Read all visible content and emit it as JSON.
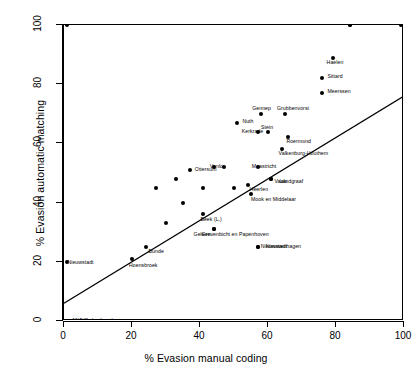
{
  "chart_data": {
    "type": "scatter",
    "title": "",
    "xlabel": "% Evasion manual coding",
    "ylabel": "% Evasion automatic matching",
    "xlim": [
      0,
      100
    ],
    "ylim": [
      0,
      100
    ],
    "xticks": [
      0,
      20,
      40,
      60,
      80,
      100
    ],
    "yticks": [
      0,
      20,
      40,
      60,
      80,
      100
    ],
    "grid": false,
    "legend": false,
    "trendline": {
      "description": "linear regression line",
      "x_start": 0,
      "y_start": 6,
      "x_end": 100,
      "y_end": 76
    },
    "points": [
      {
        "label": "Schinnen",
        "x": 1,
        "y": 100,
        "label_dx": 6,
        "label_dy": -2
      },
      {
        "label": "Echt",
        "x": 84,
        "y": 100,
        "label_dx": -8,
        "label_dy": -6
      },
      {
        "label": "Eijsden",
        "x": 84,
        "y": 100,
        "label_dx": -3,
        "label_dy": -6
      },
      {
        "label": "",
        "x": 99,
        "y": 100,
        "label_dx": 0,
        "label_dy": 0
      },
      {
        "label": "Sc",
        "x": 100,
        "y": 100,
        "label_dx": 5,
        "label_dy": -2
      },
      {
        "label": "Haelen",
        "x": 79,
        "y": 89,
        "label_dx": -6,
        "label_dy": 4
      },
      {
        "label": "Sittard",
        "x": 76,
        "y": 82,
        "label_dx": 5,
        "label_dy": -2
      },
      {
        "label": "Meerssen",
        "x": 76,
        "y": 77,
        "label_dx": 5,
        "label_dy": -2
      },
      {
        "label": "Gennep",
        "x": 58,
        "y": 70,
        "label_dx": -9,
        "label_dy": -6
      },
      {
        "label": "Grubbenvorst",
        "x": 65,
        "y": 70,
        "label_dx": -8,
        "label_dy": -6
      },
      {
        "label": "Nuth",
        "x": 51,
        "y": 67,
        "label_dx": 5,
        "label_dy": -2
      },
      {
        "label": "Kerkrade",
        "x": 57,
        "y": 64,
        "label_dx": -16,
        "label_dy": -1
      },
      {
        "label": "Stein",
        "x": 60,
        "y": 64,
        "label_dx": -7,
        "label_dy": -5
      },
      {
        "label": "Roermond",
        "x": 66,
        "y": 62,
        "label_dx": -2,
        "label_dy": 4
      },
      {
        "label": "Valkenburg-Houthem",
        "x": 64,
        "y": 58,
        "label_dx": -3,
        "label_dy": 4
      },
      {
        "label": "Venlo",
        "x": 47,
        "y": 52,
        "label_dx": -14,
        "label_dy": -1
      },
      {
        "label": "Maastricht",
        "x": 57,
        "y": 52,
        "label_dx": -6,
        "label_dy": -1
      },
      {
        "label": "Ottersum",
        "x": 37,
        "y": 51,
        "label_dx": 5,
        "label_dy": -1
      },
      {
        "label": "Vaals",
        "x": 61,
        "y": 48,
        "label_dx": 3,
        "label_dy": 2
      },
      {
        "label": "Landgraaf",
        "x": 61,
        "y": 48,
        "label_dx": 8,
        "label_dy": 2
      },
      {
        "label": "Heerlen",
        "x": 54,
        "y": 46,
        "label_dx": 2,
        "label_dy": 4
      },
      {
        "label": "Mook en Middelaar",
        "x": 55,
        "y": 43,
        "label_dx": 0,
        "label_dy": 5
      },
      {
        "label": "",
        "x": 44,
        "y": 52,
        "label_dx": 0,
        "label_dy": 0
      },
      {
        "label": "",
        "x": 33,
        "y": 48,
        "label_dx": 0,
        "label_dy": 0
      },
      {
        "label": "",
        "x": 41,
        "y": 45,
        "label_dx": 0,
        "label_dy": 0
      },
      {
        "label": "",
        "x": 50,
        "y": 45,
        "label_dx": 0,
        "label_dy": 0
      },
      {
        "label": "",
        "x": 27,
        "y": 45,
        "label_dx": 0,
        "label_dy": 0
      },
      {
        "label": "",
        "x": 35,
        "y": 40,
        "label_dx": 0,
        "label_dy": 0
      },
      {
        "label": "Beek (L.)",
        "x": 41,
        "y": 36,
        "label_dx": -3,
        "label_dy": 5
      },
      {
        "label": "Grevenbicht en Papenhoven",
        "x": 44,
        "y": 31,
        "label_dx": -12,
        "label_dy": 5
      },
      {
        "label": "Geleen",
        "x": 44,
        "y": 31,
        "label_dx": -20,
        "label_dy": 5
      },
      {
        "label": "",
        "x": 30,
        "y": 33,
        "label_dx": 0,
        "label_dy": 0
      },
      {
        "label": "Bunde",
        "x": 24,
        "y": 25,
        "label_dx": 3,
        "label_dy": 4
      },
      {
        "label": "Nieuwstadt",
        "x": 57,
        "y": 25,
        "label_dx": 3,
        "label_dy": -1
      },
      {
        "label": "Nieuwenhagen",
        "x": 57,
        "y": 25,
        "label_dx": 8,
        "label_dy": -1
      },
      {
        "label": "Hoensbroek",
        "x": 20,
        "y": 21,
        "label_dx": -3,
        "label_dy": 6
      },
      {
        "label": "Nieuwstadt",
        "x": 1,
        "y": 20,
        "label_dx": 0,
        "label_dy": 0
      },
      {
        "label": "Melick",
        "x": 1,
        "y": 0,
        "label_dx": 5,
        "label_dy": -1
      },
      {
        "label": "Vlodrop",
        "x": 1,
        "y": 0,
        "label_dx": 10,
        "label_dy": -1
      },
      {
        "label": "Herkenbosch",
        "x": 1,
        "y": 0,
        "label_dx": 16,
        "label_dy": -1
      },
      {
        "label": "Sc",
        "x": 100,
        "y": 0,
        "label_dx": 5,
        "label_dy": -1
      }
    ]
  }
}
